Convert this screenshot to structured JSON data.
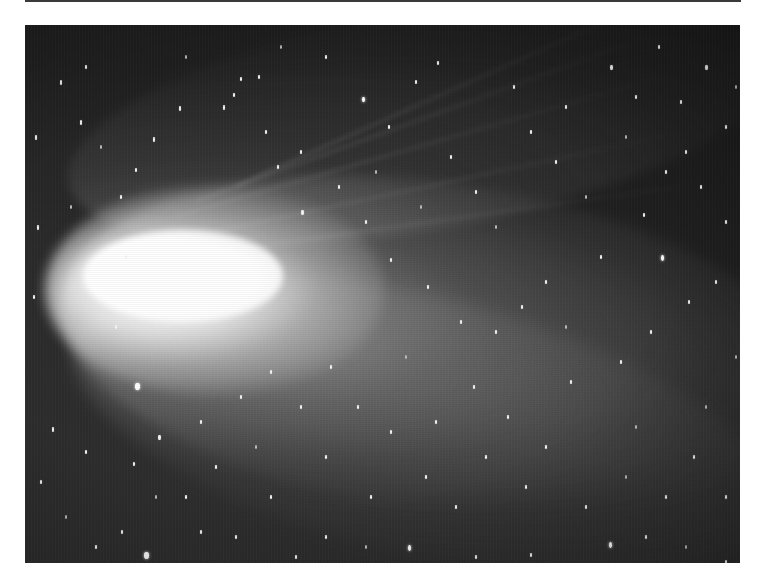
{
  "page": {
    "background": "#ffffff",
    "rule_color": "#3a3a3a"
  },
  "photo": {
    "subject": "comet with bright coma and fanned dust and ion tails against star field",
    "palette": {
      "sky": "#222222",
      "coma": "#ffffff",
      "tail": "#b4b4b4",
      "star": "#f4f4f4"
    },
    "coma_center": [
      85,
      265
    ],
    "tail_direction": "right",
    "ion_streaks": [
      {
        "x": 150,
        "y": 190,
        "len": 520,
        "angle": -16
      },
      {
        "x": 170,
        "y": 175,
        "len": 500,
        "angle": -20
      },
      {
        "x": 190,
        "y": 205,
        "len": 480,
        "angle": -12
      },
      {
        "x": 210,
        "y": 160,
        "len": 460,
        "angle": -24
      },
      {
        "x": 230,
        "y": 220,
        "len": 460,
        "angle": -8
      }
    ],
    "stars": [
      {
        "x": 110,
        "y": 358,
        "w": 5,
        "h": 7,
        "k": "bright"
      },
      {
        "x": 119,
        "y": 527,
        "w": 5,
        "h": 7,
        "k": "bright"
      },
      {
        "x": 636,
        "y": 230,
        "w": 3,
        "h": 6,
        "k": "bright"
      },
      {
        "x": 383,
        "y": 520,
        "w": 3,
        "h": 6,
        "k": "bright"
      },
      {
        "x": 584,
        "y": 517,
        "w": 3,
        "h": 6,
        "k": "bright"
      },
      {
        "x": 337,
        "y": 72,
        "w": 3,
        "h": 5,
        "k": "bright"
      },
      {
        "x": 276,
        "y": 185,
        "w": 3,
        "h": 5,
        "k": ""
      },
      {
        "x": 154,
        "y": 81,
        "w": 2,
        "h": 5,
        "k": ""
      },
      {
        "x": 55,
        "y": 95,
        "w": 2,
        "h": 5,
        "k": ""
      },
      {
        "x": 10,
        "y": 110,
        "w": 2,
        "h": 5,
        "k": ""
      },
      {
        "x": 60,
        "y": 40,
        "w": 2,
        "h": 4,
        "k": ""
      },
      {
        "x": 35,
        "y": 55,
        "w": 2,
        "h": 5,
        "k": ""
      },
      {
        "x": 90,
        "y": 300,
        "w": 2,
        "h": 4,
        "k": ""
      },
      {
        "x": 198,
        "y": 80,
        "w": 2,
        "h": 5,
        "k": ""
      },
      {
        "x": 208,
        "y": 68,
        "w": 2,
        "h": 4,
        "k": ""
      },
      {
        "x": 215,
        "y": 52,
        "w": 2,
        "h": 4,
        "k": ""
      },
      {
        "x": 233,
        "y": 50,
        "w": 2,
        "h": 4,
        "k": ""
      },
      {
        "x": 240,
        "y": 105,
        "w": 2,
        "h": 4,
        "k": ""
      },
      {
        "x": 252,
        "y": 140,
        "w": 2,
        "h": 4,
        "k": ""
      },
      {
        "x": 128,
        "y": 112,
        "w": 2,
        "h": 5,
        "k": ""
      },
      {
        "x": 95,
        "y": 170,
        "w": 2,
        "h": 4,
        "k": ""
      },
      {
        "x": 110,
        "y": 143,
        "w": 2,
        "h": 4,
        "k": ""
      },
      {
        "x": 100,
        "y": 230,
        "w": 2,
        "h": 4,
        "k": ""
      },
      {
        "x": 12,
        "y": 200,
        "w": 2,
        "h": 5,
        "k": ""
      },
      {
        "x": 8,
        "y": 270,
        "w": 2,
        "h": 4,
        "k": ""
      },
      {
        "x": 300,
        "y": 30,
        "w": 2,
        "h": 4,
        "k": ""
      },
      {
        "x": 363,
        "y": 100,
        "w": 2,
        "h": 4,
        "k": ""
      },
      {
        "x": 390,
        "y": 55,
        "w": 2,
        "h": 4,
        "k": ""
      },
      {
        "x": 412,
        "y": 36,
        "w": 2,
        "h": 4,
        "k": ""
      },
      {
        "x": 425,
        "y": 130,
        "w": 2,
        "h": 4,
        "k": ""
      },
      {
        "x": 450,
        "y": 165,
        "w": 2,
        "h": 4,
        "k": ""
      },
      {
        "x": 488,
        "y": 60,
        "w": 2,
        "h": 4,
        "k": ""
      },
      {
        "x": 505,
        "y": 105,
        "w": 2,
        "h": 4,
        "k": ""
      },
      {
        "x": 530,
        "y": 135,
        "w": 2,
        "h": 4,
        "k": ""
      },
      {
        "x": 540,
        "y": 80,
        "w": 2,
        "h": 4,
        "k": ""
      },
      {
        "x": 585,
        "y": 40,
        "w": 3,
        "h": 5,
        "k": ""
      },
      {
        "x": 610,
        "y": 70,
        "w": 2,
        "h": 4,
        "k": ""
      },
      {
        "x": 633,
        "y": 20,
        "w": 2,
        "h": 4,
        "k": ""
      },
      {
        "x": 655,
        "y": 75,
        "w": 2,
        "h": 4,
        "k": ""
      },
      {
        "x": 680,
        "y": 40,
        "w": 3,
        "h": 5,
        "k": ""
      },
      {
        "x": 700,
        "y": 100,
        "w": 2,
        "h": 4,
        "k": ""
      },
      {
        "x": 660,
        "y": 125,
        "w": 2,
        "h": 4,
        "k": ""
      },
      {
        "x": 675,
        "y": 160,
        "w": 2,
        "h": 4,
        "k": ""
      },
      {
        "x": 700,
        "y": 195,
        "w": 2,
        "h": 4,
        "k": ""
      },
      {
        "x": 640,
        "y": 145,
        "w": 2,
        "h": 4,
        "k": ""
      },
      {
        "x": 663,
        "y": 275,
        "w": 2,
        "h": 4,
        "k": ""
      },
      {
        "x": 690,
        "y": 255,
        "w": 2,
        "h": 4,
        "k": ""
      },
      {
        "x": 618,
        "y": 188,
        "w": 2,
        "h": 4,
        "k": ""
      },
      {
        "x": 575,
        "y": 230,
        "w": 2,
        "h": 4,
        "k": ""
      },
      {
        "x": 520,
        "y": 255,
        "w": 2,
        "h": 4,
        "k": ""
      },
      {
        "x": 496,
        "y": 280,
        "w": 2,
        "h": 4,
        "k": ""
      },
      {
        "x": 470,
        "y": 305,
        "w": 2,
        "h": 4,
        "k": ""
      },
      {
        "x": 435,
        "y": 295,
        "w": 2,
        "h": 4,
        "k": ""
      },
      {
        "x": 402,
        "y": 260,
        "w": 2,
        "h": 4,
        "k": ""
      },
      {
        "x": 365,
        "y": 233,
        "w": 2,
        "h": 4,
        "k": ""
      },
      {
        "x": 340,
        "y": 195,
        "w": 2,
        "h": 4,
        "k": ""
      },
      {
        "x": 313,
        "y": 160,
        "w": 2,
        "h": 4,
        "k": ""
      },
      {
        "x": 275,
        "y": 125,
        "w": 2,
        "h": 4,
        "k": ""
      },
      {
        "x": 305,
        "y": 340,
        "w": 2,
        "h": 4,
        "k": ""
      },
      {
        "x": 332,
        "y": 380,
        "w": 2,
        "h": 4,
        "k": ""
      },
      {
        "x": 365,
        "y": 405,
        "w": 2,
        "h": 4,
        "k": ""
      },
      {
        "x": 410,
        "y": 395,
        "w": 2,
        "h": 4,
        "k": ""
      },
      {
        "x": 448,
        "y": 360,
        "w": 2,
        "h": 4,
        "k": ""
      },
      {
        "x": 482,
        "y": 390,
        "w": 2,
        "h": 4,
        "k": ""
      },
      {
        "x": 520,
        "y": 420,
        "w": 2,
        "h": 4,
        "k": ""
      },
      {
        "x": 545,
        "y": 355,
        "w": 2,
        "h": 4,
        "k": ""
      },
      {
        "x": 595,
        "y": 335,
        "w": 2,
        "h": 4,
        "k": ""
      },
      {
        "x": 625,
        "y": 305,
        "w": 2,
        "h": 4,
        "k": ""
      },
      {
        "x": 640,
        "y": 470,
        "w": 2,
        "h": 4,
        "k": ""
      },
      {
        "x": 668,
        "y": 430,
        "w": 2,
        "h": 4,
        "k": ""
      },
      {
        "x": 700,
        "y": 470,
        "w": 2,
        "h": 4,
        "k": ""
      },
      {
        "x": 620,
        "y": 510,
        "w": 2,
        "h": 4,
        "k": ""
      },
      {
        "x": 560,
        "y": 480,
        "w": 2,
        "h": 4,
        "k": ""
      },
      {
        "x": 500,
        "y": 460,
        "w": 2,
        "h": 4,
        "k": ""
      },
      {
        "x": 460,
        "y": 430,
        "w": 2,
        "h": 4,
        "k": ""
      },
      {
        "x": 430,
        "y": 480,
        "w": 2,
        "h": 4,
        "k": ""
      },
      {
        "x": 400,
        "y": 450,
        "w": 2,
        "h": 4,
        "k": ""
      },
      {
        "x": 345,
        "y": 470,
        "w": 2,
        "h": 4,
        "k": ""
      },
      {
        "x": 300,
        "y": 430,
        "w": 2,
        "h": 4,
        "k": ""
      },
      {
        "x": 275,
        "y": 380,
        "w": 2,
        "h": 4,
        "k": ""
      },
      {
        "x": 245,
        "y": 345,
        "w": 2,
        "h": 4,
        "k": ""
      },
      {
        "x": 215,
        "y": 370,
        "w": 2,
        "h": 4,
        "k": ""
      },
      {
        "x": 175,
        "y": 395,
        "w": 2,
        "h": 4,
        "k": ""
      },
      {
        "x": 133,
        "y": 410,
        "w": 3,
        "h": 5,
        "k": ""
      },
      {
        "x": 108,
        "y": 437,
        "w": 2,
        "h": 4,
        "k": ""
      },
      {
        "x": 60,
        "y": 425,
        "w": 2,
        "h": 4,
        "k": ""
      },
      {
        "x": 27,
        "y": 402,
        "w": 2,
        "h": 5,
        "k": ""
      },
      {
        "x": 15,
        "y": 455,
        "w": 2,
        "h": 4,
        "k": ""
      },
      {
        "x": 70,
        "y": 520,
        "w": 2,
        "h": 4,
        "k": ""
      },
      {
        "x": 96,
        "y": 505,
        "w": 2,
        "h": 4,
        "k": ""
      },
      {
        "x": 175,
        "y": 505,
        "w": 2,
        "h": 4,
        "k": ""
      },
      {
        "x": 210,
        "y": 510,
        "w": 2,
        "h": 4,
        "k": ""
      },
      {
        "x": 245,
        "y": 470,
        "w": 2,
        "h": 4,
        "k": ""
      },
      {
        "x": 270,
        "y": 530,
        "w": 2,
        "h": 4,
        "k": ""
      },
      {
        "x": 300,
        "y": 510,
        "w": 2,
        "h": 4,
        "k": ""
      },
      {
        "x": 160,
        "y": 470,
        "w": 2,
        "h": 4,
        "k": ""
      },
      {
        "x": 190,
        "y": 440,
        "w": 2,
        "h": 4,
        "k": ""
      },
      {
        "x": 450,
        "y": 530,
        "w": 2,
        "h": 4,
        "k": ""
      },
      {
        "x": 505,
        "y": 528,
        "w": 2,
        "h": 4,
        "k": ""
      },
      {
        "x": 700,
        "y": 535,
        "w": 2,
        "h": 4,
        "k": ""
      },
      {
        "x": 45,
        "y": 180,
        "w": 2,
        "h": 4,
        "k": "faint"
      },
      {
        "x": 75,
        "y": 120,
        "w": 2,
        "h": 4,
        "k": "faint"
      },
      {
        "x": 160,
        "y": 30,
        "w": 2,
        "h": 4,
        "k": "faint"
      },
      {
        "x": 255,
        "y": 20,
        "w": 2,
        "h": 4,
        "k": "faint"
      },
      {
        "x": 350,
        "y": 145,
        "w": 2,
        "h": 4,
        "k": "faint"
      },
      {
        "x": 395,
        "y": 180,
        "w": 2,
        "h": 4,
        "k": "faint"
      },
      {
        "x": 470,
        "y": 200,
        "w": 2,
        "h": 4,
        "k": "faint"
      },
      {
        "x": 560,
        "y": 170,
        "w": 2,
        "h": 4,
        "k": "faint"
      },
      {
        "x": 600,
        "y": 110,
        "w": 2,
        "h": 4,
        "k": "faint"
      },
      {
        "x": 710,
        "y": 60,
        "w": 2,
        "h": 4,
        "k": "faint"
      },
      {
        "x": 710,
        "y": 330,
        "w": 2,
        "h": 4,
        "k": "faint"
      },
      {
        "x": 680,
        "y": 380,
        "w": 2,
        "h": 4,
        "k": "faint"
      },
      {
        "x": 610,
        "y": 400,
        "w": 2,
        "h": 4,
        "k": "faint"
      },
      {
        "x": 540,
        "y": 300,
        "w": 2,
        "h": 4,
        "k": "faint"
      },
      {
        "x": 380,
        "y": 330,
        "w": 2,
        "h": 4,
        "k": "faint"
      },
      {
        "x": 230,
        "y": 420,
        "w": 2,
        "h": 4,
        "k": "faint"
      },
      {
        "x": 130,
        "y": 470,
        "w": 2,
        "h": 4,
        "k": "faint"
      },
      {
        "x": 40,
        "y": 490,
        "w": 2,
        "h": 4,
        "k": "faint"
      },
      {
        "x": 340,
        "y": 520,
        "w": 2,
        "h": 4,
        "k": "faint"
      },
      {
        "x": 600,
        "y": 450,
        "w": 2,
        "h": 4,
        "k": "faint"
      },
      {
        "x": 660,
        "y": 520,
        "w": 2,
        "h": 4,
        "k": "faint"
      }
    ]
  }
}
